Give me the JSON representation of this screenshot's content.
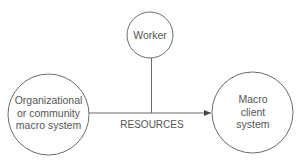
{
  "diagram": {
    "colors": {
      "stroke": "#6b6b6b",
      "text": "#555555",
      "background": "#ffffff"
    },
    "nodes": {
      "worker": {
        "lines": [
          "Worker"
        ]
      },
      "source": {
        "lines": [
          "Organizational",
          "or community",
          "macro system"
        ]
      },
      "target": {
        "lines": [
          "Macro",
          "client",
          "system"
        ]
      }
    },
    "edges": {
      "resources": {
        "label": "RESOURCES",
        "from": "Organizational or community macro system",
        "to": "Macro client system",
        "arrow": "arrow-right"
      },
      "worker_link": {
        "from": "Worker",
        "to": "RESOURCES flow"
      }
    }
  }
}
